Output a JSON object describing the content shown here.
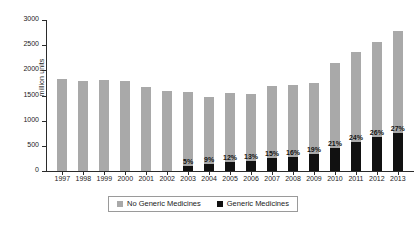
{
  "chart_data": {
    "type": "bar",
    "stacked": true,
    "title": "",
    "xlabel": "",
    "ylabel": "million units",
    "ylim": [
      0,
      3000
    ],
    "ytick_labels": [
      "0",
      "500",
      "1000",
      "1500",
      "2000",
      "2500",
      "3000"
    ],
    "yticks": [
      0,
      500,
      1000,
      1500,
      2000,
      2500,
      3000
    ],
    "grid": false,
    "legend_position": "bottom-center",
    "categories": [
      "1997",
      "1998",
      "1999",
      "2000",
      "2001",
      "2002",
      "2003",
      "2004",
      "2005",
      "2006",
      "2007",
      "2008",
      "2009",
      "2010",
      "2011",
      "2012",
      "2013"
    ],
    "series": [
      {
        "name": "No Generic Medicines",
        "color": "#a9a9a9",
        "values": [
          1820,
          1790,
          1810,
          1790,
          1660,
          1580,
          1470,
          1330,
          1360,
          1330,
          1430,
          1440,
          1420,
          1700,
          1800,
          1900,
          2030
        ]
      },
      {
        "name": "Generic Medicines",
        "color": "#111111",
        "values": [
          0,
          0,
          0,
          0,
          0,
          0,
          95,
          135,
          185,
          200,
          255,
          275,
          335,
          450,
          570,
          670,
          760
        ]
      }
    ],
    "totals": [
      1820,
      1790,
      1810,
      1790,
      1660,
      1580,
      1565,
      1465,
      1545,
      1530,
      1685,
      1715,
      1755,
      2150,
      2370,
      2570,
      2790
    ],
    "data_labels": [
      "",
      "",
      "",
      "",
      "",
      "",
      "5%",
      "9%",
      "12%",
      "13%",
      "15%",
      "16%",
      "19%",
      "21%",
      "24%",
      "26%",
      "27%"
    ]
  },
  "legend": {
    "items": [
      {
        "label": "No Generic Medicines",
        "swatch": "gray"
      },
      {
        "label": "Generic Medicines",
        "swatch": "black"
      }
    ]
  }
}
